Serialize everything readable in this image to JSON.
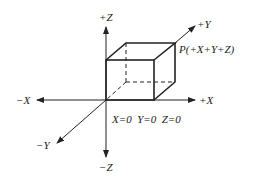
{
  "diagram": {
    "type": "3d-coordinate-system",
    "axes": {
      "pos_x": "+X",
      "neg_x": "−X",
      "pos_y": "+Y",
      "neg_y": "−Y",
      "pos_z": "+Z",
      "neg_z": "−Z"
    },
    "origin_label": "X=0  Y=0  Z=0",
    "point_label": "P(+X+Y+Z)",
    "colors": {
      "stroke": "#222222",
      "background": "#ffffff"
    }
  }
}
